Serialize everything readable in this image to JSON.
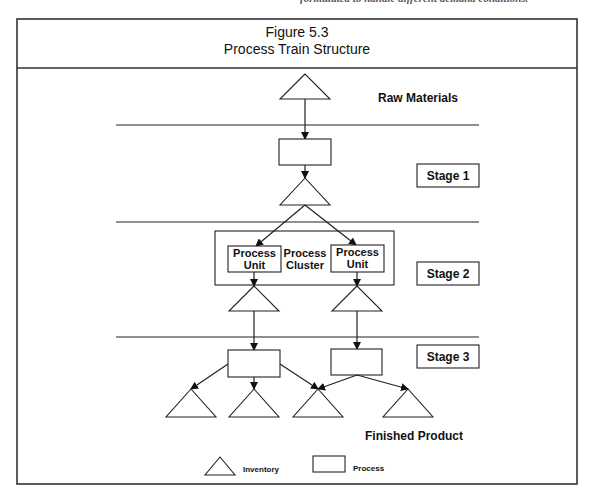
{
  "page_header_cutoff": "formulated to handle different demand conditions.",
  "figure": {
    "number": "Figure 5.3",
    "title": "Process Train Structure"
  },
  "labels": {
    "raw_materials": "Raw Materials",
    "finished_product": "Finished Product",
    "process_cluster_line1": "Process",
    "process_cluster_line2": "Cluster",
    "process_unit_line1": "Process",
    "process_unit_line2": "Unit"
  },
  "stages": [
    {
      "label": "Stage 1"
    },
    {
      "label": "Stage 2"
    },
    {
      "label": "Stage 3"
    }
  ],
  "legend": {
    "inventory": "Inventory",
    "process": "Process"
  },
  "nodes": {
    "raw_inventory": {
      "type": "inventory",
      "stage": 0
    },
    "stage1_process": {
      "type": "process",
      "stage": 1
    },
    "stage1_inventory": {
      "type": "inventory",
      "stage": 1
    },
    "stage2_cluster": {
      "type": "cluster",
      "stage": 2,
      "units": [
        "stage2_unit_left",
        "stage2_unit_right"
      ]
    },
    "stage2_unit_left": {
      "type": "process-unit",
      "stage": 2
    },
    "stage2_unit_right": {
      "type": "process-unit",
      "stage": 2
    },
    "stage2_inventory_left": {
      "type": "inventory",
      "stage": 2
    },
    "stage2_inventory_right": {
      "type": "inventory",
      "stage": 2
    },
    "stage3_process_left": {
      "type": "process",
      "stage": 3
    },
    "stage3_process_right": {
      "type": "process",
      "stage": 3
    },
    "finished_inventory_1": {
      "type": "inventory",
      "stage": 3
    },
    "finished_inventory_2": {
      "type": "inventory",
      "stage": 3
    },
    "finished_inventory_3": {
      "type": "inventory",
      "stage": 3
    },
    "finished_inventory_4": {
      "type": "inventory",
      "stage": 3
    }
  },
  "edges": [
    [
      "raw_inventory",
      "stage1_process"
    ],
    [
      "stage1_process",
      "stage1_inventory"
    ],
    [
      "stage1_inventory",
      "stage2_unit_left"
    ],
    [
      "stage1_inventory",
      "stage2_unit_right"
    ],
    [
      "stage2_unit_left",
      "stage2_inventory_left"
    ],
    [
      "stage2_unit_right",
      "stage2_inventory_right"
    ],
    [
      "stage2_inventory_left",
      "stage3_process_left"
    ],
    [
      "stage2_inventory_right",
      "stage3_process_right"
    ],
    [
      "stage3_process_left",
      "finished_inventory_1"
    ],
    [
      "stage3_process_left",
      "finished_inventory_2"
    ],
    [
      "stage3_process_left",
      "finished_inventory_3"
    ],
    [
      "stage3_process_right",
      "finished_inventory_3"
    ],
    [
      "stage3_process_right",
      "finished_inventory_4"
    ]
  ]
}
